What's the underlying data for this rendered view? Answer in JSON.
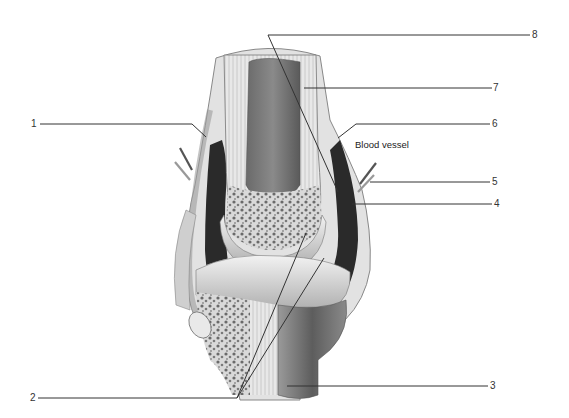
{
  "diagram": {
    "annotation": "Blood vessel",
    "callouts": [
      {
        "id": "1",
        "label": "1"
      },
      {
        "id": "2",
        "label": "2"
      },
      {
        "id": "3",
        "label": "3"
      },
      {
        "id": "4",
        "label": "4"
      },
      {
        "id": "5",
        "label": "5"
      },
      {
        "id": "6",
        "label": "6"
      },
      {
        "id": "7",
        "label": "7"
      },
      {
        "id": "8",
        "label": "8"
      }
    ],
    "colors": {
      "ink": "#333333",
      "cavity": "#2a2a2a",
      "bone_shaft": "#6e6e6e",
      "cartilage": "#dcdcdc",
      "spongy": "#bdbdbd",
      "capsule": "#cfcfcf"
    }
  }
}
